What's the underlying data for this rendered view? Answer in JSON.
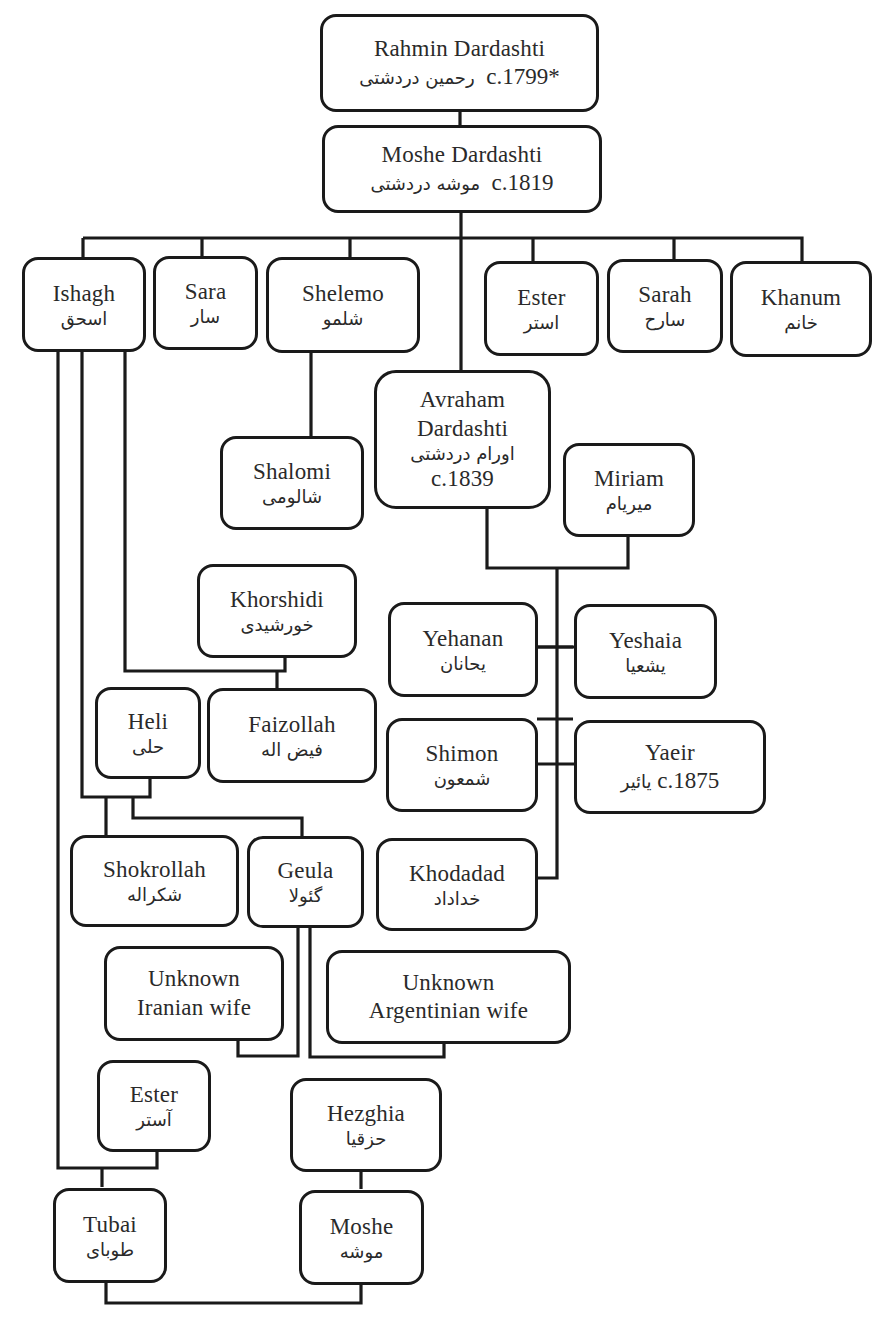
{
  "nodes": {
    "rahmin": {
      "en": "Rahmin Dardashti",
      "date": "c.1799*",
      "fa": "رحمین دردشتی"
    },
    "moshe_sr": {
      "en": "Moshe Dardashti",
      "date": "c.1819",
      "fa": "موشه دردشتی"
    },
    "ishagh": {
      "en": "Ishagh",
      "fa": "اسحق"
    },
    "sara": {
      "en": "Sara",
      "fa": "سار"
    },
    "shelemo": {
      "en": "Shelemo",
      "fa": "شلمو"
    },
    "ester1": {
      "en": "Ester",
      "fa": "استر"
    },
    "sarah": {
      "en": "Sarah",
      "fa": "سارح"
    },
    "khanum": {
      "en": "Khanum",
      "fa": "خانم"
    },
    "shalomi": {
      "en": "Shalomi",
      "fa": "شالومی"
    },
    "avraham": {
      "en1": "Avraham",
      "en2": "Dardashti",
      "fa": "اورام دردشتی",
      "date": "c.1839"
    },
    "miriam": {
      "en": "Miriam",
      "fa": "میریام"
    },
    "khorshidi": {
      "en": "Khorshidi",
      "fa": "خورشیدی"
    },
    "yehanan": {
      "en": "Yehanan",
      "fa": "یحانان"
    },
    "yeshaia": {
      "en": "Yeshaia",
      "fa": "یشعیا"
    },
    "heli": {
      "en": "Heli",
      "fa": "حلی"
    },
    "faizollah": {
      "en": "Faizollah",
      "fa": "فیض اله"
    },
    "shimon": {
      "en": "Shimon",
      "fa": "شمعون"
    },
    "yaeir": {
      "en": "Yaeir",
      "date": "c.1875",
      "fa": "یائیر"
    },
    "shokrollah": {
      "en": "Shokrollah",
      "fa": "شکراله"
    },
    "geula": {
      "en": "Geula",
      "fa": "گئولا"
    },
    "khodadad": {
      "en": "Khodadad",
      "fa": "خداداد"
    },
    "iranian_wife": {
      "en1": "Unknown",
      "en2": "Iranian wife"
    },
    "argentinian_wife": {
      "en1": "Unknown",
      "en2": "Argentinian wife"
    },
    "ester2": {
      "en": "Ester",
      "fa": "آستر"
    },
    "hezghia": {
      "en": "Hezghia",
      "fa": "حزقیا"
    },
    "tubai": {
      "en": "Tubai",
      "fa": "طوبای"
    },
    "moshe_jr": {
      "en": "Moshe",
      "fa": "موشه"
    }
  }
}
